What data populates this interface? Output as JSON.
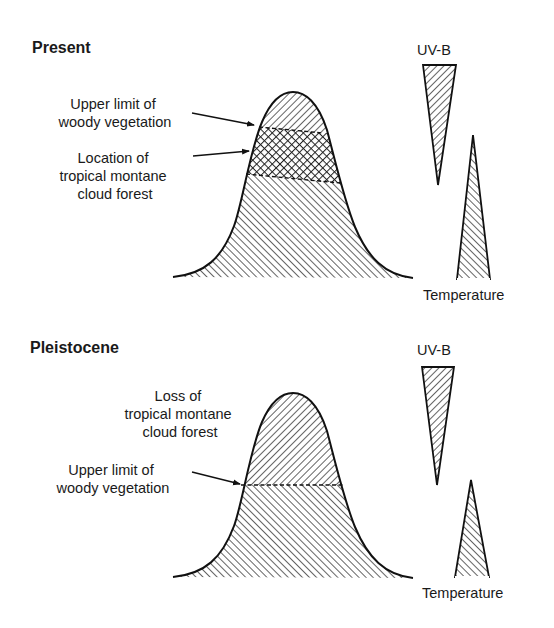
{
  "figure": {
    "panels": [
      {
        "id": "present",
        "title": "Present",
        "labels": {
          "upper_limit": [
            "Upper limit of",
            "woody vegetation"
          ],
          "cloud_forest": [
            "Location of",
            "tropical montane",
            "cloud forest"
          ]
        },
        "gradient_labels": {
          "uvb": "UV-B",
          "temperature": "Temperature"
        }
      },
      {
        "id": "pleistocene",
        "title": "Pleistocene",
        "labels": {
          "cloud_forest": [
            "Loss of",
            "tropical montane",
            "cloud forest"
          ],
          "upper_limit": [
            "Upper limit of",
            "woody vegetation"
          ]
        },
        "gradient_labels": {
          "uvb": "UV-B",
          "temperature": "Temperature"
        }
      }
    ],
    "colors": {
      "ink": "#111111",
      "background": "#ffffff"
    }
  }
}
